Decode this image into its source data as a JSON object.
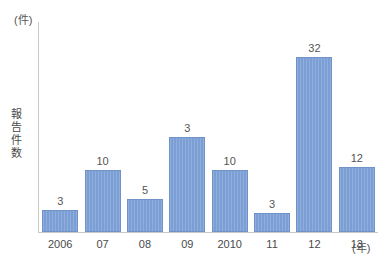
{
  "chart_data": {
    "type": "bar",
    "title": "",
    "subtitle": "",
    "xlabel": "(年)",
    "ylabel": "報告件数",
    "y_unit_caption": "(件)",
    "categories": [
      "2006",
      "07",
      "08",
      "09",
      "2010",
      "11",
      "12",
      "13"
    ],
    "values": [
      3,
      10,
      5,
      3,
      10,
      3,
      32,
      12
    ],
    "value_labels": [
      "3",
      "10",
      "5",
      "3",
      "10",
      "3",
      "32",
      "12"
    ],
    "bar_pixel_heights": [
      22,
      62,
      33,
      95,
      62,
      19,
      175,
      65
    ],
    "ylim": [
      0,
      36
    ],
    "grid": false,
    "legend": null,
    "series": [
      {
        "name": "報告件数",
        "values": [
          3,
          10,
          5,
          3,
          10,
          3,
          32,
          12
        ]
      }
    ],
    "colors": {
      "bar_fill": "#7b9fd4",
      "bar_border": "#6f93c9",
      "axis_line": "#c9c9c9",
      "label_text": "#555555",
      "background": "#ffffff"
    }
  },
  "axis": {
    "y_unit": "(件)",
    "y_title": "報告件数",
    "x_unit": "(年)"
  }
}
